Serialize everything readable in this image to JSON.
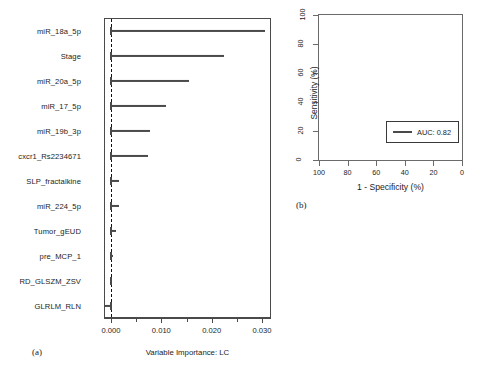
{
  "figure": {
    "panel_a_tag": "(a)",
    "panel_b_tag": "(b)"
  },
  "chart_data": [
    {
      "type": "bar",
      "orientation": "horizontal",
      "panel": "(a)",
      "title": "",
      "xlabel": "Variable Importance: LC",
      "ylabel": "",
      "xlim": [
        -0.0022,
        0.0332
      ],
      "xticks": [
        0.0,
        0.01,
        0.02,
        0.03
      ],
      "xtick_labels": [
        "0.000",
        "0.010",
        "0.020",
        "0.030"
      ],
      "minor_xticks": [
        0.005,
        0.015,
        0.025
      ],
      "grid": false,
      "reference_line": 0.0,
      "reference_line_style": "dashed",
      "categories": [
        "miR_18a_5p",
        "Stage",
        "miR_20a_5p",
        "miR_17_5p",
        "miR_19b_3p",
        "cxcr1_Rs2234671",
        "SLP_fractalkine",
        "miR_224_5p",
        "Tumor_gEUD",
        "pre_MCP_1",
        "RD_GLSZM_ZSV",
        "GLRLM_RLN"
      ],
      "values": [
        0.0306,
        0.0224,
        0.0155,
        0.011,
        0.0078,
        0.0073,
        0.0016,
        0.0015,
        0.001,
        0.0001,
        -0.0001,
        -0.0014
      ]
    },
    {
      "type": "line",
      "subtype": "roc",
      "panel": "(b)",
      "title": "",
      "xlabel": "1 - Specificity (%)",
      "ylabel": "Sensitivity (%)",
      "xlim": [
        100,
        0
      ],
      "ylim": [
        0,
        100
      ],
      "x_reversed": true,
      "xticks": [
        100,
        80,
        60,
        40,
        20,
        0
      ],
      "xtick_labels": [
        "100",
        "80",
        "60",
        "40",
        "20",
        "0"
      ],
      "yticks": [
        0,
        20,
        40,
        60,
        80,
        100
      ],
      "ytick_labels": [
        "0",
        "20",
        "40",
        "60",
        "80",
        "100"
      ],
      "grid": false,
      "legend_position": "bottom-right",
      "legend_entries": [
        "AUC: 0.82"
      ],
      "auc": 0.82,
      "diagonal_reference": true,
      "series": [
        {
          "name": "ROC curve",
          "color": "#4a4a4a",
          "points": [
            [
              100,
              0
            ],
            [
              100,
              40
            ],
            [
              97,
              40
            ],
            [
              97,
              55
            ],
            [
              94,
              55
            ],
            [
              94,
              62
            ],
            [
              91,
              62
            ],
            [
              91,
              66
            ],
            [
              86,
              66
            ],
            [
              86,
              70
            ],
            [
              81,
              70
            ],
            [
              81,
              73
            ],
            [
              76,
              73
            ],
            [
              76,
              78
            ],
            [
              68,
              78
            ],
            [
              68,
              82
            ],
            [
              58,
              82
            ],
            [
              58,
              86
            ],
            [
              52,
              86
            ],
            [
              52,
              90
            ],
            [
              42,
              90
            ],
            [
              42,
              93
            ],
            [
              22,
              93
            ],
            [
              22,
              95
            ],
            [
              8,
              95
            ],
            [
              8,
              97
            ],
            [
              3,
              97
            ],
            [
              3,
              99
            ],
            [
              0,
              99
            ],
            [
              0,
              100
            ]
          ]
        },
        {
          "name": "CI upper bound",
          "color": "#9a9a9a",
          "points": [
            [
              100,
              62
            ],
            [
              96,
              72
            ],
            [
              90,
              80
            ],
            [
              82,
              86
            ],
            [
              72,
              90
            ],
            [
              60,
              94
            ],
            [
              50,
              96
            ],
            [
              38,
              97
            ],
            [
              24,
              98
            ],
            [
              12,
              99
            ],
            [
              0,
              100
            ]
          ]
        },
        {
          "name": "CI lower bound",
          "color": "#9a9a9a",
          "points": [
            [
              100,
              28
            ],
            [
              96,
              34
            ],
            [
              90,
              44
            ],
            [
              82,
              52
            ],
            [
              72,
              58
            ],
            [
              62,
              64
            ],
            [
              52,
              70
            ],
            [
              42,
              76
            ],
            [
              30,
              82
            ],
            [
              18,
              89
            ],
            [
              8,
              94
            ],
            [
              0,
              100
            ]
          ]
        }
      ],
      "ci_band_fill": "#e8e8e8"
    }
  ],
  "panel_a": {
    "tag": "(a)",
    "xtitle": "Variable Importance: LC",
    "xtick_labels": [
      "0.000",
      "0.010",
      "0.020",
      "0.030"
    ],
    "rows": [
      {
        "label": "miR_18a_5p",
        "value": 0.0306
      },
      {
        "label": "Stage",
        "value": 0.0224
      },
      {
        "label": "miR_20a_5p",
        "value": 0.0155
      },
      {
        "label": "miR_17_5p",
        "value": 0.011
      },
      {
        "label": "miR_19b_3p",
        "value": 0.0078
      },
      {
        "label": "cxcr1_Rs2234671",
        "value": 0.0073
      },
      {
        "label": "SLP_fractalkine",
        "value": 0.0016
      },
      {
        "label": "miR_224_5p",
        "value": 0.0015
      },
      {
        "label": "Tumor_gEUD",
        "value": 0.001
      },
      {
        "label": "pre_MCP_1",
        "value": 0.0001
      },
      {
        "label": "RD_GLSZM_ZSV",
        "value": -0.0001
      },
      {
        "label": "GLRLM_RLN",
        "value": -0.0014
      }
    ]
  },
  "panel_b": {
    "tag": "(b)",
    "xtitle": "1 - Specificity (%)",
    "ytitle": "Sensitivity (%)",
    "xtick_labels": [
      "100",
      "80",
      "60",
      "40",
      "20",
      "0"
    ],
    "ytick_labels": [
      "0",
      "20",
      "40",
      "60",
      "80",
      "100"
    ],
    "legend_label": "AUC: 0.82"
  },
  "colors": {
    "curve": "#4a4a4a",
    "ci_line": "#9a9a9a",
    "ci_fill": "#e8e8e8",
    "axis": "#4a4a4a",
    "diagonal": "#dcdcdc",
    "text": "#1c1c1c"
  }
}
